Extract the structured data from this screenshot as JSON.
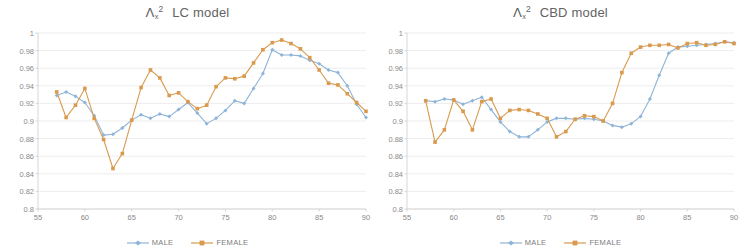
{
  "figure": {
    "panels": [
      {
        "id": "lc",
        "title": {
          "symbol": "Λ",
          "subscript": "x",
          "superscript": "2",
          "model": "LC model"
        }
      },
      {
        "id": "cbd",
        "title": {
          "symbol": "Λ",
          "subscript": "x",
          "superscript": "2",
          "model": "CBD model"
        }
      }
    ]
  },
  "colors": {
    "male": "#8eb4d8",
    "female": "#d99a4e",
    "grid": "#e9e9e9",
    "axis": "#d2d2d2",
    "text": "#8a8a8a",
    "title": "#636363",
    "background": "#ffffff"
  },
  "chart_data": [
    {
      "type": "line",
      "id": "lc",
      "title": "Λx²  LC model",
      "xlabel": "",
      "ylabel": "",
      "xlim": [
        55,
        90
      ],
      "ylim": [
        0.8,
        1.0
      ],
      "xticks": [
        55,
        60,
        65,
        70,
        75,
        80,
        85,
        90
      ],
      "yticks": [
        0.8,
        0.82,
        0.84,
        0.86,
        0.88,
        0.9,
        0.92,
        0.94,
        0.96,
        0.98,
        1
      ],
      "grid": true,
      "legend_position": "bottom",
      "x": [
        57,
        58,
        59,
        60,
        61,
        62,
        63,
        64,
        65,
        66,
        67,
        68,
        69,
        70,
        71,
        72,
        73,
        74,
        75,
        76,
        77,
        78,
        79,
        80,
        81,
        82,
        83,
        84,
        85,
        86,
        87,
        88,
        89,
        90
      ],
      "series": [
        {
          "name": "MALE",
          "color": "#8eb4d8",
          "values": [
            0.929,
            0.933,
            0.928,
            0.921,
            0.906,
            0.884,
            0.885,
            0.892,
            0.901,
            0.907,
            0.903,
            0.908,
            0.905,
            0.913,
            0.921,
            0.909,
            0.897,
            0.903,
            0.912,
            0.923,
            0.92,
            0.937,
            0.954,
            0.981,
            0.975,
            0.975,
            0.974,
            0.969,
            0.965,
            0.958,
            0.955,
            0.94,
            0.919,
            0.904
          ]
        },
        {
          "name": "FEMALE",
          "color": "#d99a4e",
          "values": [
            0.933,
            0.904,
            0.918,
            0.937,
            0.903,
            0.879,
            0.846,
            0.863,
            0.901,
            0.938,
            0.958,
            0.949,
            0.929,
            0.932,
            0.922,
            0.914,
            0.918,
            0.939,
            0.949,
            0.948,
            0.951,
            0.966,
            0.981,
            0.989,
            0.992,
            0.988,
            0.982,
            0.972,
            0.958,
            0.943,
            0.941,
            0.931,
            0.921,
            0.911
          ]
        }
      ]
    },
    {
      "type": "line",
      "id": "cbd",
      "title": "Λx²  CBD model",
      "xlabel": "",
      "ylabel": "",
      "xlim": [
        55,
        90
      ],
      "ylim": [
        0.8,
        1.0
      ],
      "xticks": [
        55,
        60,
        65,
        70,
        75,
        80,
        85,
        90
      ],
      "yticks": [
        0.8,
        0.82,
        0.84,
        0.86,
        0.88,
        0.9,
        0.92,
        0.94,
        0.96,
        0.98,
        1
      ],
      "grid": true,
      "legend_position": "bottom",
      "x": [
        57,
        58,
        59,
        60,
        61,
        62,
        63,
        64,
        65,
        66,
        67,
        68,
        69,
        70,
        71,
        72,
        73,
        74,
        75,
        76,
        77,
        78,
        79,
        80,
        81,
        82,
        83,
        84,
        85,
        86,
        87,
        88,
        89,
        90
      ],
      "series": [
        {
          "name": "MALE",
          "color": "#8eb4d8",
          "values": [
            0.923,
            0.922,
            0.925,
            0.924,
            0.919,
            0.923,
            0.927,
            0.913,
            0.899,
            0.888,
            0.882,
            0.882,
            0.89,
            0.899,
            0.903,
            0.903,
            0.902,
            0.903,
            0.902,
            0.9,
            0.895,
            0.893,
            0.897,
            0.905,
            0.925,
            0.952,
            0.977,
            0.984,
            0.985,
            0.986,
            0.987,
            0.988,
            0.99,
            0.989
          ]
        },
        {
          "name": "FEMALE",
          "color": "#d99a4e",
          "values": [
            0.923,
            0.876,
            0.89,
            0.924,
            0.911,
            0.89,
            0.922,
            0.925,
            0.903,
            0.912,
            0.913,
            0.912,
            0.908,
            0.903,
            0.882,
            0.888,
            0.902,
            0.906,
            0.905,
            0.9,
            0.92,
            0.955,
            0.977,
            0.984,
            0.986,
            0.986,
            0.987,
            0.983,
            0.988,
            0.989,
            0.986,
            0.987,
            0.99,
            0.988
          ]
        }
      ]
    }
  ]
}
